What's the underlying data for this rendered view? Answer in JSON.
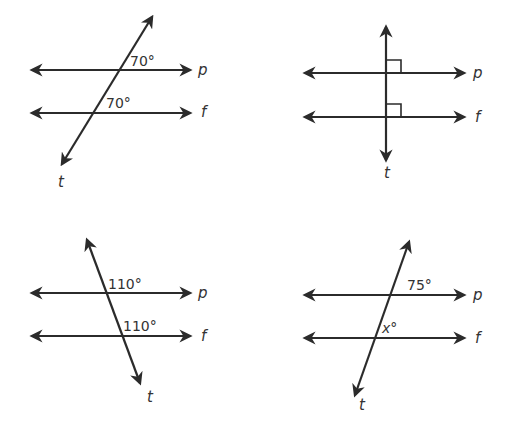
{
  "diagrams": [
    {
      "id": "top-left",
      "parallel_lines": [
        "p",
        "f"
      ],
      "transversal": "t",
      "angles": [
        {
          "line": "p",
          "label": "70°"
        },
        {
          "line": "f",
          "label": "70°"
        }
      ],
      "labels": {
        "p": "p",
        "f": "f",
        "t": "t"
      }
    },
    {
      "id": "top-right",
      "parallel_lines": [
        "p",
        "f"
      ],
      "transversal": "t",
      "angles": [
        {
          "line": "p",
          "label": "right-angle"
        },
        {
          "line": "f",
          "label": "right-angle"
        }
      ],
      "labels": {
        "p": "p",
        "f": "f",
        "t": "t"
      }
    },
    {
      "id": "bottom-left",
      "parallel_lines": [
        "p",
        "f"
      ],
      "transversal": "t",
      "angles": [
        {
          "line": "p",
          "label": "110°"
        },
        {
          "line": "f",
          "label": "110°"
        }
      ],
      "labels": {
        "p": "p",
        "f": "f",
        "t": "t"
      }
    },
    {
      "id": "bottom-right",
      "parallel_lines": [
        "p",
        "f"
      ],
      "transversal": "t",
      "angles": [
        {
          "line": "p",
          "label": "75°"
        },
        {
          "line": "f",
          "label": "x°"
        }
      ],
      "labels": {
        "p": "p",
        "f": "f",
        "t": "t"
      }
    }
  ],
  "colors": {
    "ink": "#2b2b2b",
    "background": "#ffffff"
  }
}
